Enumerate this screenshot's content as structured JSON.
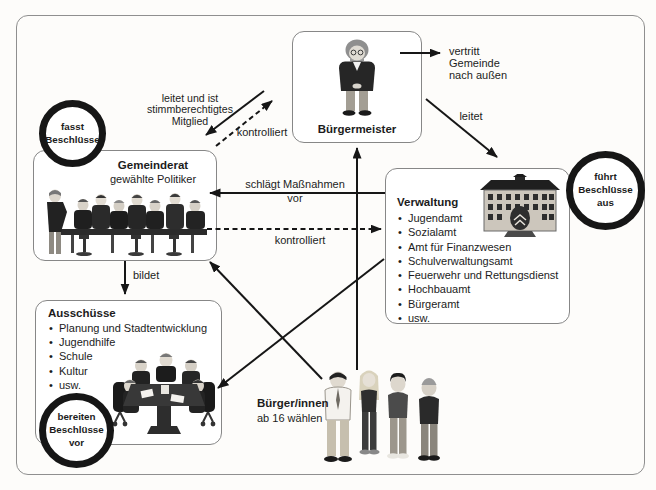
{
  "diagram": {
    "background": "#fdfcfa",
    "frame_border": "#8f8f8f",
    "ink": "#161616",
    "box_background": "#ffffff"
  },
  "nodes": {
    "buergermeister": {
      "title": "Bürgermeister"
    },
    "gemeinderat": {
      "title": "Gemeinderat",
      "subtitle": "gewählte Politiker"
    },
    "verwaltung": {
      "title": "Verwaltung",
      "items": [
        "Jugendamt",
        "Sozialamt",
        "Amt für Finanzwesen",
        "Schulverwaltungsamt",
        "Feuerwehr und Rettungsdienst",
        "Hochbauamt",
        "Bürgeramt",
        "usw."
      ]
    },
    "ausschuesse": {
      "title": "Ausschüsse",
      "items": [
        "Planung und Stadtentwicklung",
        "Jugendhilfe",
        "Schule",
        "Kultur",
        "usw."
      ]
    },
    "buerger": {
      "title": "Bürger/innen",
      "subtitle": "ab 16 wählen"
    }
  },
  "badges": {
    "fasst": {
      "text": "fasst\nBeschlüsse"
    },
    "fuehrt": {
      "text": "führt\nBeschlüsse\naus"
    },
    "bereiten": {
      "text": "bereiten\nBeschlüsse\nvor"
    }
  },
  "edges": {
    "vertritt": {
      "label": "vertritt\nGemeinde\nnach außen",
      "style": "solid"
    },
    "leitet_verwaltung": {
      "label": "leitet",
      "style": "solid"
    },
    "leitet_mitglied": {
      "label": "leitet und ist\nstimmberechtigtes\nMitglied",
      "style": "solid"
    },
    "kontrolliert_buergermeister": {
      "label": "kontrolliert",
      "style": "dashed"
    },
    "schlaegt_massnahmen": {
      "label": "schlägt Maßnahmen\nvor",
      "style": "solid"
    },
    "kontrolliert_verwaltung": {
      "label": "kontrolliert",
      "style": "dashed"
    },
    "bildet": {
      "label": "bildet",
      "style": "solid"
    }
  }
}
